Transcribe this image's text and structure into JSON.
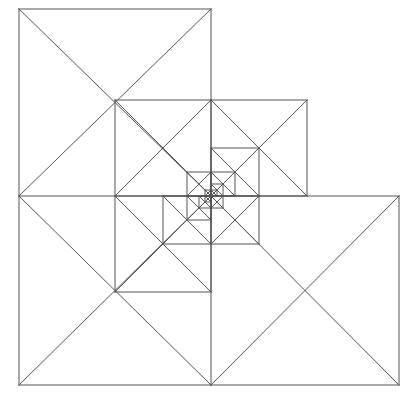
{
  "figure": {
    "title": "Recursive L-tromino pinwheel fractal",
    "type": "geometric-line-drawing",
    "canvas": {
      "width": 416,
      "height": 402,
      "background_color": "#ffffff"
    },
    "style": {
      "stroke_color": "#555555",
      "stroke_width": 1,
      "fill": "none"
    },
    "construction": {
      "outer_bounds": {
        "left": 19,
        "top": 9,
        "right": 399,
        "bottom": 385
      },
      "pivot": {
        "x": 211,
        "y": 196,
        "label": "inner-corner-vertex"
      },
      "initial_half_size": 192,
      "recursion_depth": 6,
      "scale_factor": 0.5,
      "rotation_per_level_deg": 180,
      "squares_per_level": 3,
      "diagonals_per_square": 2
    },
    "levels": [
      {
        "index": 0,
        "half_size": 192,
        "squares": 3,
        "note": "outermost L: top-left, bottom-left, bottom-right"
      },
      {
        "index": 1,
        "half_size": 96,
        "squares": 3,
        "note": "rotated 180 deg, anchored at centre pivot"
      },
      {
        "index": 2,
        "half_size": 48,
        "squares": 3,
        "note": "rotated 360 deg"
      },
      {
        "index": 3,
        "half_size": 24,
        "squares": 3,
        "note": "rotated 180 deg"
      },
      {
        "index": 4,
        "half_size": 12,
        "squares": 3,
        "note": "rotated 360 deg"
      },
      {
        "index": 5,
        "half_size": 6,
        "squares": 3,
        "note": "innermost visible detail"
      }
    ]
  }
}
